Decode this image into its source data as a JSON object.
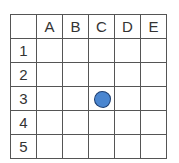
{
  "board": {
    "columns": [
      "A",
      "B",
      "C",
      "D",
      "E"
    ],
    "rows": [
      "1",
      "2",
      "3",
      "4",
      "5"
    ],
    "pieces": [
      {
        "cell": "C3",
        "row": 3,
        "col": "C",
        "color": "#4a86d0",
        "outline": "#1f3f70",
        "shape": "circle"
      }
    ]
  }
}
